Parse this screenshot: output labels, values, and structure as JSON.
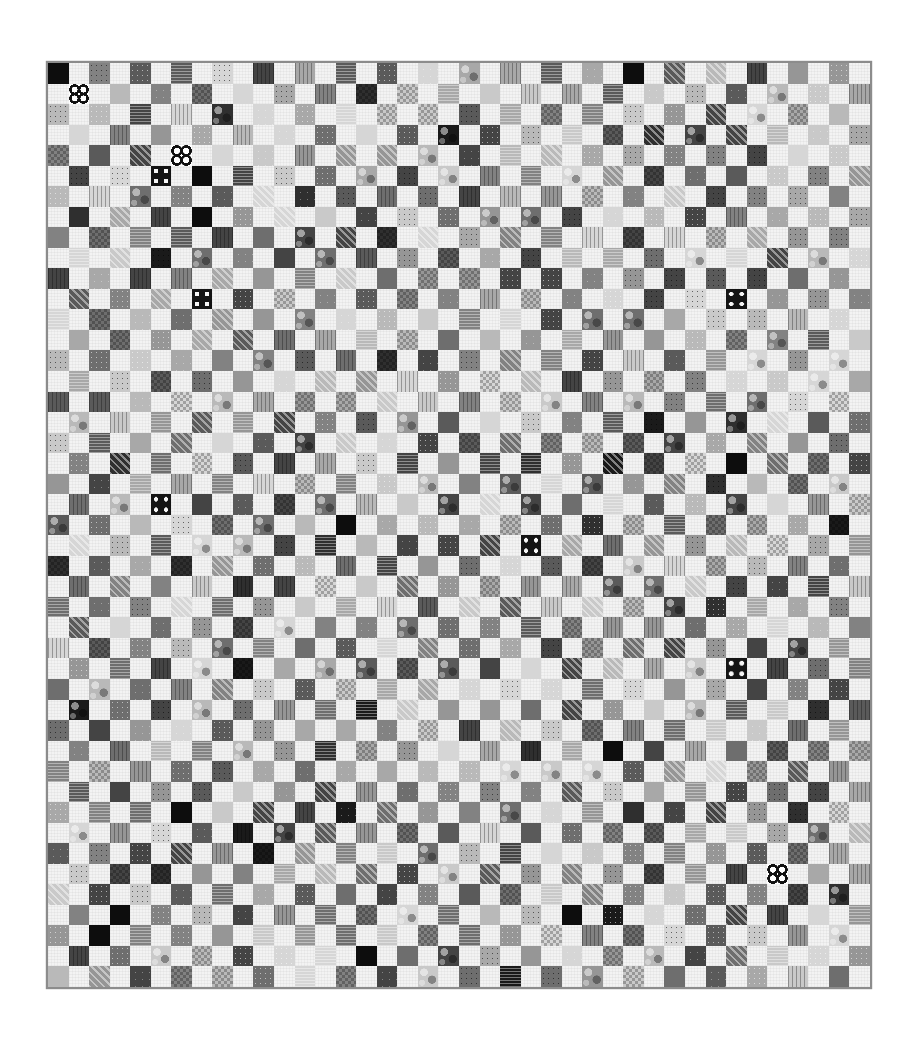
{
  "image": {
    "subject": "Black-and-white photograph of a checkerboard patchwork quilt",
    "description": "Printed fabric squares alternate with white/off-white squares in a checkerboard layout, finished with a gray binding",
    "background_color": "#ffffff"
  },
  "quilt": {
    "columns": 40,
    "rows": 45,
    "layout": "checkerboard",
    "first_printed_parity": 0,
    "binding_color": "#8c8c8c",
    "white_square_color": "#f3f3f3",
    "shade_palette": [
      "#1a1a1a",
      "#2f2f2f",
      "#444444",
      "#5a5a5a",
      "#6e6e6e",
      "#828282",
      "#969696",
      "#a8a8a8",
      "#b9b9b9",
      "#c9c9c9",
      "#d6d6d6"
    ],
    "patterns": [
      "none",
      "dots",
      "dotsdark",
      "stripe",
      "hstripe",
      "vstripe",
      "check",
      "floral",
      "speckle"
    ],
    "seed": 20240611,
    "notable_squares": [
      {
        "row": 1,
        "col": 1,
        "motif": "flower"
      },
      {
        "row": 4,
        "col": 6,
        "motif": "flower"
      },
      {
        "row": 5,
        "col": 5,
        "motif": "bigdots"
      },
      {
        "row": 5,
        "col": 7,
        "motif": "solidblack"
      },
      {
        "row": 0,
        "col": 0,
        "motif": "solidblack"
      },
      {
        "row": 0,
        "col": 28,
        "motif": "solidblack"
      },
      {
        "row": 3,
        "col": 18,
        "motif": "solidblack"
      },
      {
        "row": 7,
        "col": 7,
        "motif": "solidblack"
      },
      {
        "row": 8,
        "col": 39,
        "motif": "bigdots"
      },
      {
        "row": 11,
        "col": 7,
        "motif": "bigdots"
      },
      {
        "row": 11,
        "col": 33,
        "motif": "bigdots"
      },
      {
        "row": 13,
        "col": 6,
        "motif": "solidblack"
      },
      {
        "row": 14,
        "col": 21,
        "motif": "solidblack"
      },
      {
        "row": 19,
        "col": 33,
        "motif": "solidblack"
      },
      {
        "row": 21,
        "col": 5,
        "motif": "bigdots"
      },
      {
        "row": 22,
        "col": 14,
        "motif": "solidblack"
      },
      {
        "row": 23,
        "col": 14,
        "motif": "solidblack"
      },
      {
        "row": 23,
        "col": 23,
        "motif": "bigdots"
      },
      {
        "row": 25,
        "col": 0,
        "motif": "solidblack"
      },
      {
        "row": 26,
        "col": 25,
        "motif": "solidblack"
      },
      {
        "row": 28,
        "col": 19,
        "motif": "solidblack"
      },
      {
        "row": 29,
        "col": 33,
        "motif": "bigdots"
      },
      {
        "row": 31,
        "col": 8,
        "motif": "bigdots"
      },
      {
        "row": 33,
        "col": 27,
        "motif": "solidblack"
      },
      {
        "row": 35,
        "col": 0,
        "motif": "bigdots"
      },
      {
        "row": 36,
        "col": 6,
        "motif": "solidblack"
      },
      {
        "row": 37,
        "col": 36,
        "motif": "bigdots"
      },
      {
        "row": 39,
        "col": 35,
        "motif": "flower"
      },
      {
        "row": 41,
        "col": 3,
        "motif": "solidblack"
      },
      {
        "row": 42,
        "col": 2,
        "motif": "solidblack"
      },
      {
        "row": 43,
        "col": 15,
        "motif": "solidblack"
      },
      {
        "row": 41,
        "col": 25,
        "motif": "solidblack"
      }
    ]
  }
}
